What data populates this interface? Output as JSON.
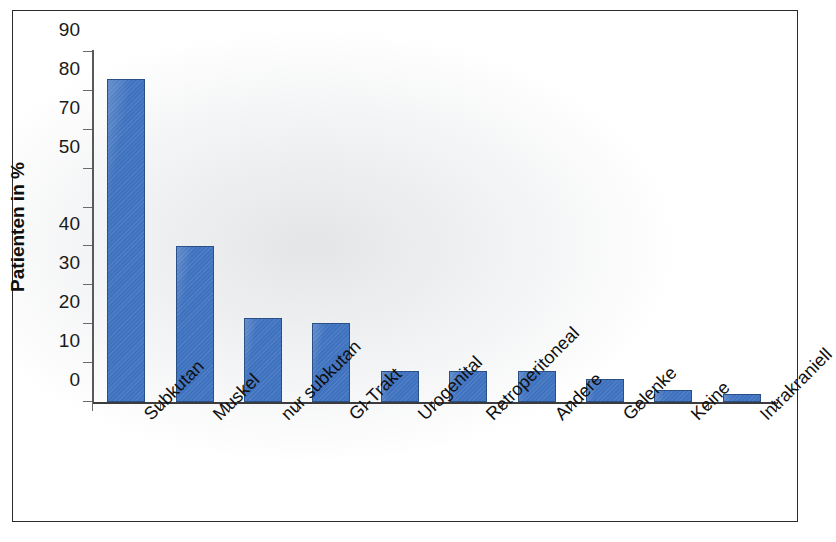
{
  "chart_data": {
    "type": "bar",
    "title": "",
    "xlabel": "",
    "ylabel": "Patienten in %",
    "ylim": [
      0,
      90
    ],
    "grid": false,
    "legend": "none",
    "bar_color": "#3f72bf",
    "bar_edge_color": "#2a5088",
    "categories": [
      "Subkutan",
      "Muskel",
      "nur subkutan",
      "GI-Trakt",
      "Urogenital",
      "Retroperitoneal",
      "Andere",
      "Gelenke",
      "Keine",
      "Intrakraniell"
    ],
    "values": [
      83,
      40,
      21.5,
      20.3,
      8,
      8,
      8,
      5.8,
      3,
      2
    ],
    "ytick_values": [
      0,
      10,
      20,
      30,
      40,
      50,
      60,
      70,
      80,
      90
    ],
    "ytick_labels": [
      "0",
      "10",
      "20",
      "30",
      "40",
      "50",
      "70",
      "80",
      "90"
    ],
    "ytick_labels_positions": [
      0,
      10,
      20,
      30,
      40,
      60,
      70,
      80,
      90
    ],
    "note_on_tick_labels": "Printed axis shows 90, 80, 70, 50, 40, 30, 20, 10, 0 - the tick at the 60 position is printed as 50 in the source figure."
  },
  "axis": {
    "y_title": "Patienten in %"
  }
}
